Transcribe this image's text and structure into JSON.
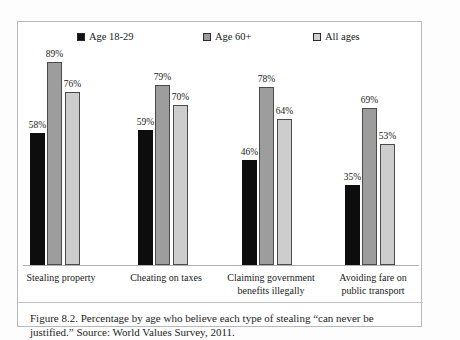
{
  "figure": {
    "caption": "Figure 8.2. Percentage by age who believe each type of stealing “can never be justified.” Source: World Values Survey, 2011."
  },
  "colors": {
    "series_age_18_29": "#0d0d0d",
    "series_age_60_plus": "#9d9d9d",
    "series_all_ages": "#cdcdcd",
    "axis": "#b0b0b0",
    "frame": "#b9b9b9",
    "text": "#1a1a1a",
    "background": "#ffffff"
  },
  "legend": {
    "position": "top",
    "entries": [
      {
        "label": "Age 18-29",
        "swatch": "black-square-swatch"
      },
      {
        "label": "Age 60+",
        "swatch": "gray-square-swatch"
      },
      {
        "label": "All ages",
        "swatch": "light-gray-square-swatch"
      }
    ]
  },
  "categories": [
    {
      "line1": "Stealing property",
      "line2": ""
    },
    {
      "line1": "Cheating on taxes",
      "line2": ""
    },
    {
      "line1": "Claiming government",
      "line2": "benefits illegally"
    },
    {
      "line1": "Avoiding fare on",
      "line2": "public transport"
    }
  ],
  "bars": [
    {
      "group": 0,
      "series": 0,
      "label": "58%",
      "value": 58
    },
    {
      "group": 0,
      "series": 1,
      "label": "89%",
      "value": 89
    },
    {
      "group": 0,
      "series": 2,
      "label": "76%",
      "value": 76
    },
    {
      "group": 1,
      "series": 0,
      "label": "59%",
      "value": 59
    },
    {
      "group": 1,
      "series": 1,
      "label": "79%",
      "value": 79
    },
    {
      "group": 1,
      "series": 2,
      "label": "70%",
      "value": 70
    },
    {
      "group": 2,
      "series": 0,
      "label": "46%",
      "value": 46
    },
    {
      "group": 2,
      "series": 1,
      "label": "78%",
      "value": 78
    },
    {
      "group": 2,
      "series": 2,
      "label": "64%",
      "value": 64
    },
    {
      "group": 3,
      "series": 0,
      "label": "35%",
      "value": 35
    },
    {
      "group": 3,
      "series": 1,
      "label": "69%",
      "value": 69
    },
    {
      "group": 3,
      "series": 2,
      "label": "53%",
      "value": 53
    }
  ],
  "chart_data": {
    "type": "bar",
    "title": "",
    "subtitle": "",
    "xlabel": "",
    "ylabel": "",
    "ylim": [
      0,
      100
    ],
    "grid": false,
    "legend_position": "top",
    "value_labels": true,
    "value_label_suffix": "%",
    "categories": [
      "Stealing property",
      "Cheating on taxes",
      "Claiming government benefits illegally",
      "Avoiding fare on public transport"
    ],
    "series": [
      {
        "name": "Age 18-29",
        "color": "#0d0d0d",
        "values": [
          58,
          59,
          46,
          35
        ]
      },
      {
        "name": "Age 60+",
        "color": "#9d9d9d",
        "values": [
          89,
          79,
          78,
          69
        ]
      },
      {
        "name": "All ages",
        "color": "#cdcdcd",
        "values": [
          76,
          70,
          64,
          53
        ]
      }
    ],
    "annotations": [
      "Figure 8.2. Percentage by age who believe each type of stealing “can never be justified.” Source: World Values Survey, 2011."
    ]
  }
}
